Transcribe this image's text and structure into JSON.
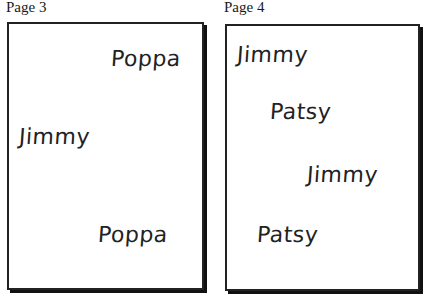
{
  "pages": [
    {
      "label": "Page 3",
      "words": [
        "Poppa",
        "Jimmy",
        "Poppa"
      ]
    },
    {
      "label": "Page 4",
      "words": [
        "Jimmy",
        "Patsy",
        "Jimmy",
        "Patsy"
      ]
    }
  ]
}
